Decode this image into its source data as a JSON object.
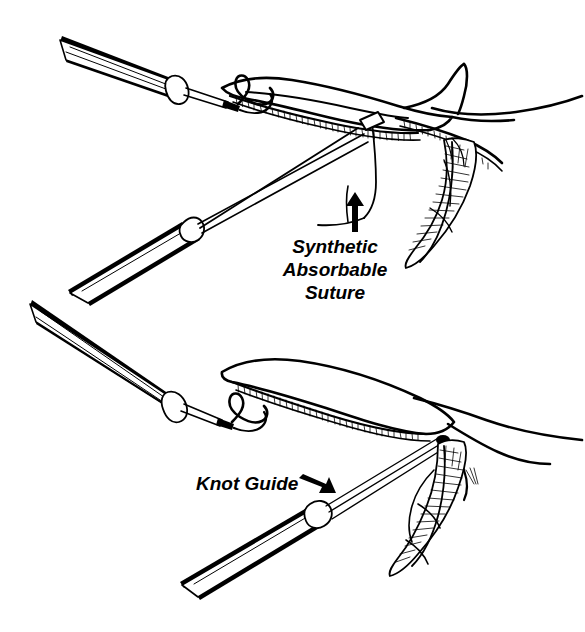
{
  "figure": {
    "background_color": "#ffffff",
    "ink_color": "#000000",
    "width": 585,
    "height": 632,
    "style": "black-and-white line drawing"
  },
  "panels": [
    {
      "id": "upper-panel",
      "name": "suture-passing-panel",
      "description": "Suture hook passing a synthetic absorbable suture through the tissue edge",
      "labels": [
        {
          "id": "synthetic-absorbable-suture",
          "lines": [
            "Synthetic",
            "Absorbable",
            "Suture"
          ],
          "font_size": 19,
          "x": 335,
          "y": 247,
          "line_height": 23,
          "anchor": "middle",
          "pointer": "arrow-up"
        }
      ],
      "annotations": [
        {
          "id": "suture-arrow",
          "icon": "arrow-up-icon",
          "direction": "up",
          "x": 355,
          "y_start": 232,
          "y_end": 196
        }
      ],
      "instruments": [
        {
          "id": "suture-hook",
          "name": "suture-hook-instrument",
          "tip": "hook"
        },
        {
          "id": "lower-cannula",
          "name": "lower-cannula-instrument",
          "tip": "open-end"
        }
      ]
    },
    {
      "id": "lower-panel",
      "name": "knot-tying-panel",
      "description": "Knot guide advancing the knot down to the tissue surface",
      "labels": [
        {
          "id": "knot-guide",
          "lines": [
            "Knot Guide"
          ],
          "font_size": 19,
          "x": 196,
          "y": 484,
          "line_height": 23,
          "anchor": "start",
          "pointer": "arrow-right-down"
        }
      ],
      "annotations": [
        {
          "id": "knot-guide-arrow",
          "icon": "arrow-right-down-icon",
          "direction": "right-down",
          "x_start": 305,
          "y_start": 477,
          "x_end": 334,
          "y_end": 492
        }
      ],
      "instruments": [
        {
          "id": "suture-hook-2",
          "name": "suture-hook-instrument",
          "tip": "hook"
        },
        {
          "id": "knot-guide-tube",
          "name": "knot-guide-instrument",
          "tip": "open-end"
        }
      ]
    }
  ],
  "anatomy": {
    "upper": {
      "tissue_flap": "torn tissue edge with cross-hatched shading",
      "wound_edge": "serrated / frayed margin"
    },
    "lower": {
      "tissue_flap": "torn tissue edge with cross-hatched shading",
      "knot_point": "suture knot seated at the tissue apex"
    }
  }
}
